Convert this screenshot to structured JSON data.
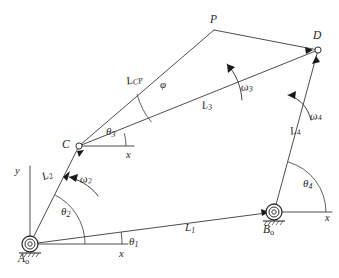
{
  "diagram": {
    "type": "mechanism-schematic",
    "background_color": "#ffffff",
    "line_color": "#3a3a3a",
    "text_color": "#1f1f1f"
  },
  "joints": [
    {
      "id": "A0",
      "name": "ground-pivot-a0",
      "label": "A",
      "subscript": "o",
      "x": 30,
      "y": 244,
      "kind": "grounded-revolute"
    },
    {
      "id": "B0",
      "name": "ground-pivot-b0",
      "label": "B",
      "subscript": "o",
      "x": 274,
      "y": 212,
      "kind": "grounded-revolute"
    },
    {
      "id": "C",
      "name": "joint-c",
      "label": "C",
      "subscript": "",
      "x": 79,
      "y": 146,
      "kind": "revolute"
    },
    {
      "id": "D",
      "name": "joint-d",
      "label": "D",
      "subscript": "",
      "x": 318,
      "y": 50,
      "kind": "revolute"
    },
    {
      "id": "P",
      "name": "coupler-point-p",
      "label": "P",
      "subscript": "",
      "x": 214,
      "y": 30,
      "kind": "coupler-point"
    }
  ],
  "links": [
    {
      "name": "link-l1-ground",
      "label": "L",
      "subscript": "1",
      "from": "A0",
      "to": "B0",
      "label_x": 185,
      "label_y": 228
    },
    {
      "name": "link-l2-crank",
      "label": "L",
      "subscript": "2",
      "from": "A0",
      "to": "C",
      "label_x": 40,
      "label_y": 178
    },
    {
      "name": "link-l3-coupler",
      "label": "L",
      "subscript": "3",
      "from": "C",
      "to": "D",
      "label_x": 205,
      "label_y": 105
    },
    {
      "name": "link-l4-rocker",
      "label": "L",
      "subscript": "4",
      "from": "B0",
      "to": "D",
      "label_x": 292,
      "label_y": 132
    },
    {
      "name": "link-lcp-coupler-extension",
      "label": "L",
      "subscript": "CP",
      "from": "C",
      "to": "P",
      "label_x": 131,
      "label_y": 80
    },
    {
      "name": "link-pd-coupler-extension",
      "label": "",
      "subscript": "",
      "from": "P",
      "to": "D",
      "label_x": 0,
      "label_y": 0
    }
  ],
  "angles": [
    {
      "name": "angle-theta1",
      "symbol": "θ",
      "subscript": "1",
      "label_x": 130,
      "label_y": 243,
      "vertex": "A0",
      "description": "ground link angle from x-axis"
    },
    {
      "name": "angle-theta2",
      "symbol": "θ",
      "subscript": "2",
      "label_x": 62,
      "label_y": 213,
      "vertex": "A0",
      "description": "crank angle from x-axis"
    },
    {
      "name": "angle-theta3",
      "symbol": "θ",
      "subscript": "3",
      "label_x": 108,
      "label_y": 132,
      "vertex": "C",
      "description": "coupler angle from x-axis at C"
    },
    {
      "name": "angle-theta4",
      "symbol": "θ",
      "subscript": "4",
      "label_x": 305,
      "label_y": 184,
      "vertex": "B0",
      "description": "rocker angle from x-axis at B0"
    },
    {
      "name": "angle-phi",
      "symbol": "φ",
      "subscript": "",
      "label_x": 163,
      "label_y": 85,
      "vertex": "C",
      "description": "coupler point offset angle between CP and CD"
    }
  ],
  "angular_velocities": [
    {
      "name": "omega2-arrow",
      "symbol": "ω",
      "subscript": "2",
      "label_x": 81,
      "label_y": 180,
      "on_link": "link-l2-crank"
    },
    {
      "name": "omega3-arrow",
      "symbol": "ω",
      "subscript": "3",
      "label_x": 243,
      "label_y": 88,
      "on_link": "link-l3-coupler"
    },
    {
      "name": "omega4-arrow",
      "symbol": "ω",
      "subscript": "4",
      "label_x": 312,
      "label_y": 117,
      "on_link": "link-l4-rocker"
    }
  ],
  "axes": [
    {
      "name": "y-axis-label",
      "label": "y",
      "x": 17,
      "y": 172,
      "orientation": "vertical",
      "origin": "A0"
    },
    {
      "name": "x-axis-label-a0",
      "label": "x",
      "x": 121,
      "y": 256,
      "orientation": "horizontal",
      "origin": "A0"
    },
    {
      "name": "x-axis-label-c",
      "label": "x",
      "x": 128,
      "y": 155,
      "orientation": "horizontal",
      "origin": "C"
    },
    {
      "name": "x-axis-label-b0",
      "label": "x",
      "x": 327,
      "y": 218,
      "orientation": "horizontal",
      "origin": "B0"
    }
  ]
}
